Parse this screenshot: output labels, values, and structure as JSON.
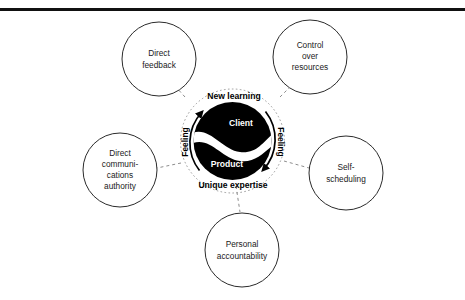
{
  "figure": {
    "faint_header": "",
    "top_rule_color": "#111111",
    "background_color": "#ffffff"
  },
  "core": {
    "disc_color": "#000000",
    "divider_color": "#ffffff",
    "upper_label": "Client",
    "lower_label": "Product",
    "ring_top_label": "New learning",
    "ring_bottom_label": "Unique expertise",
    "side_label_left": "Feeling",
    "side_label_right": "Feeling",
    "arrow_color": "#000000",
    "dotted_ring_color": "#9a9a9a"
  },
  "satellites": [
    {
      "id": "direct-feedback",
      "lines": [
        "Direct",
        "feedback"
      ],
      "cx": 159,
      "cy": 59,
      "r": 37
    },
    {
      "id": "control-over-resources",
      "lines": [
        "Control",
        "over",
        "resources"
      ],
      "cx": 310,
      "cy": 57,
      "r": 37
    },
    {
      "id": "direct-communications-authority",
      "lines": [
        "Direct",
        "communi-",
        "cations",
        "authority"
      ],
      "cx": 120,
      "cy": 170,
      "r": 37
    },
    {
      "id": "self-scheduling",
      "lines": [
        "Self-",
        "scheduling"
      ],
      "cx": 346,
      "cy": 173,
      "r": 37
    },
    {
      "id": "personal-accountability",
      "lines": [
        "Personal",
        "accountability"
      ],
      "cx": 242,
      "cy": 250,
      "r": 37
    }
  ],
  "connectors": {
    "style": "dashed",
    "color": "#8d8d8d"
  }
}
